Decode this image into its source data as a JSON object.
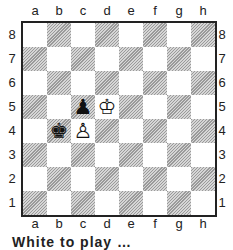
{
  "diagram": {
    "files": [
      "a",
      "b",
      "c",
      "d",
      "e",
      "f",
      "g",
      "h"
    ],
    "ranks": [
      "8",
      "7",
      "6",
      "5",
      "4",
      "3",
      "2",
      "1"
    ],
    "pieces": [
      {
        "square": "c5",
        "color": "black",
        "type": "pawn",
        "glyph": "♟"
      },
      {
        "square": "d5",
        "color": "white",
        "type": "king",
        "glyph": "♔"
      },
      {
        "square": "b4",
        "color": "black",
        "type": "king",
        "glyph": "♚"
      },
      {
        "square": "c4",
        "color": "white",
        "type": "pawn",
        "glyph": "♙"
      }
    ],
    "colors": {
      "frame": "#222222",
      "dark_hatch": "#9a9a9a",
      "light": "#ffffff"
    }
  },
  "caption": {
    "text": "White to play …"
  }
}
